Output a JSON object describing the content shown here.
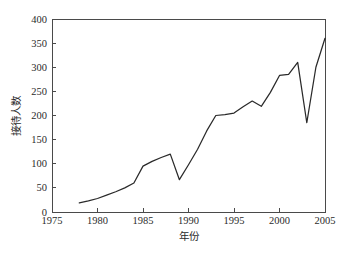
{
  "chart_data": {
    "type": "line",
    "title": "",
    "xlabel": "年份",
    "ylabel": "接待人数",
    "xlim": [
      1975,
      2005
    ],
    "ylim": [
      0,
      400
    ],
    "grid": false,
    "legend": null,
    "x_ticks": [
      1975,
      1980,
      1985,
      1990,
      1995,
      2000,
      2005
    ],
    "x_tick_labels": [
      "1975",
      "1980",
      "1985",
      "1990",
      "1995",
      "2000",
      "2005"
    ],
    "y_ticks": [
      0,
      50,
      100,
      150,
      200,
      250,
      300,
      350,
      400
    ],
    "y_tick_labels": [
      "0",
      "50",
      "100",
      "150",
      "200",
      "250",
      "300",
      "350",
      "400"
    ],
    "line_color": "#2a2a2a",
    "series": [
      {
        "name": "接待人数",
        "x": [
          1978,
          1979,
          1980,
          1981,
          1982,
          1983,
          1984,
          1985,
          1986,
          1987,
          1988,
          1989,
          1990,
          1991,
          1992,
          1993,
          1994,
          1995,
          1996,
          1997,
          1998,
          1999,
          2000,
          2001,
          2002,
          2003,
          2004,
          2005
        ],
        "values": [
          19,
          23,
          28,
          35,
          42,
          50,
          60,
          95,
          105,
          113,
          120,
          67,
          98,
          130,
          168,
          200,
          202,
          205,
          218,
          230,
          219,
          248,
          283,
          285,
          310,
          185,
          300,
          360
        ]
      }
    ]
  },
  "axis": {
    "x_title": "年份",
    "y_title": "接待人数"
  }
}
